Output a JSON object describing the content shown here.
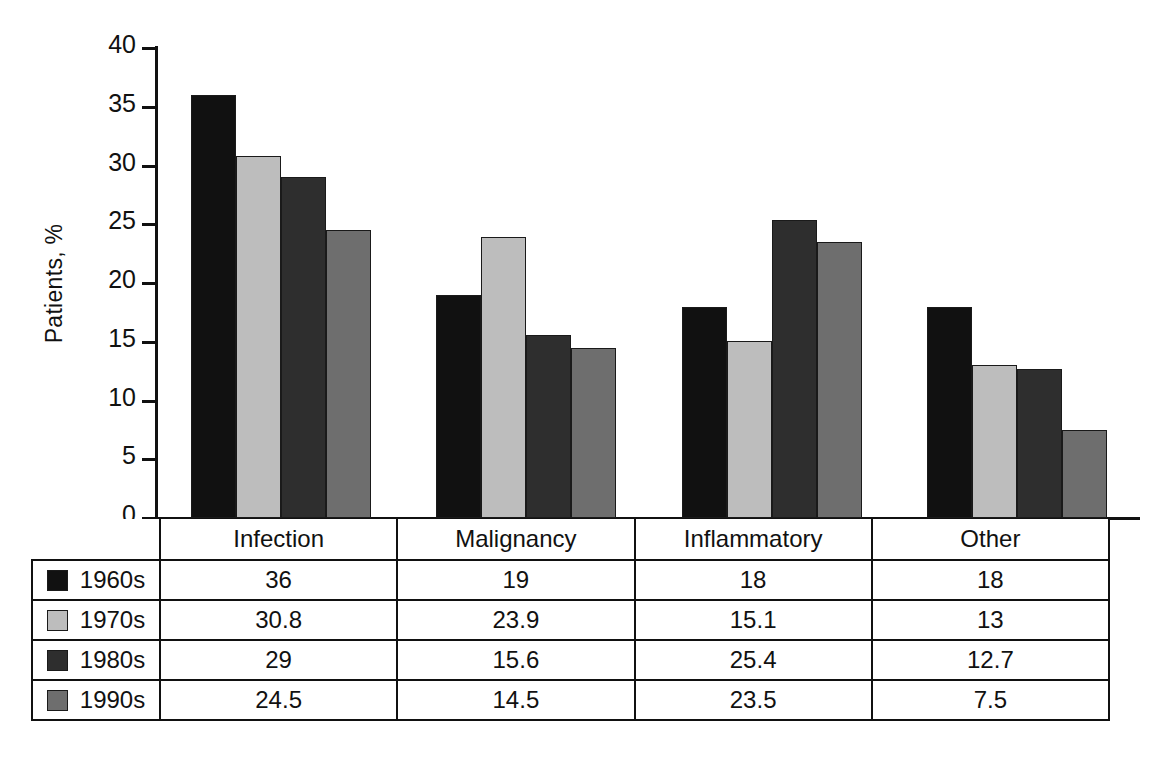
{
  "chart_data": {
    "type": "bar",
    "title": "",
    "xlabel": "",
    "ylabel": "Patients, %",
    "ylim": [
      0,
      40
    ],
    "ytick_step": 5,
    "yticks": [
      "40",
      "35",
      "30",
      "25",
      "20",
      "15",
      "10",
      "5",
      "0"
    ],
    "grid": false,
    "legend_position": "table-left-column",
    "categories": [
      "Infection",
      "Malignancy",
      "Inflammatory",
      "Other"
    ],
    "series": [
      {
        "name": "1960s",
        "color": "#111111",
        "values": [
          36,
          19,
          18,
          18
        ]
      },
      {
        "name": "1970s",
        "color": "#bdbdbd",
        "values": [
          30.8,
          23.9,
          15.1,
          13
        ]
      },
      {
        "name": "1980s",
        "color": "#2e2e2e",
        "values": [
          29,
          15.6,
          25.4,
          12.7
        ]
      },
      {
        "name": "1990s",
        "color": "#6e6e6e",
        "values": [
          24.5,
          14.5,
          23.5,
          7.5
        ]
      }
    ],
    "cell_labels": [
      [
        "36",
        "19",
        "18",
        "18"
      ],
      [
        "30.8",
        "23.9",
        "15.1",
        "13"
      ],
      [
        "29",
        "15.6",
        "25.4",
        "12.7"
      ],
      [
        "24.5",
        "14.5",
        "23.5",
        "7.5"
      ]
    ]
  },
  "axis": {
    "y_title": "Patients, %"
  },
  "table": {
    "corner_label": "",
    "header": [
      "Infection",
      "Malignancy",
      "Inflammatory",
      "Other"
    ],
    "rows": [
      {
        "label": "1960s",
        "color": "#111111",
        "values": [
          "36",
          "19",
          "18",
          "18"
        ]
      },
      {
        "label": "1970s",
        "color": "#bdbdbd",
        "values": [
          "30.8",
          "23.9",
          "15.1",
          "13"
        ]
      },
      {
        "label": "1980s",
        "color": "#2e2e2e",
        "values": [
          "29",
          "15.6",
          "25.4",
          "12.7"
        ]
      },
      {
        "label": "1990s",
        "color": "#6e6e6e",
        "values": [
          "24.5",
          "14.5",
          "23.5",
          "7.5"
        ]
      }
    ]
  }
}
